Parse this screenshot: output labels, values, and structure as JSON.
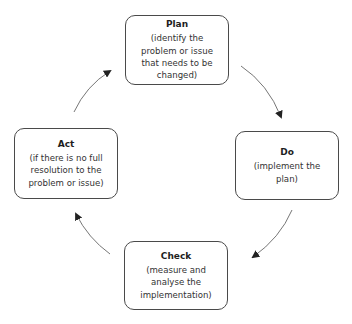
{
  "diagram": {
    "type": "cycle",
    "steps": [
      {
        "id": "plan",
        "title": "Plan",
        "description": "(identify the problem or issue that needs to be changed)"
      },
      {
        "id": "do",
        "title": "Do",
        "description": "(implement the plan)"
      },
      {
        "id": "check",
        "title": "Check",
        "description": "(measure and analyse the implementation)"
      },
      {
        "id": "act",
        "title": "Act",
        "description": "(if there is no full resolution to the problem or issue)"
      }
    ],
    "flow": [
      {
        "from": "plan",
        "to": "do"
      },
      {
        "from": "do",
        "to": "check"
      },
      {
        "from": "check",
        "to": "act"
      },
      {
        "from": "act",
        "to": "plan"
      }
    ],
    "colors": {
      "border": "#4a4a4a",
      "arrow": "#555555",
      "arrowhead": "#222222",
      "text": "#222222"
    }
  }
}
